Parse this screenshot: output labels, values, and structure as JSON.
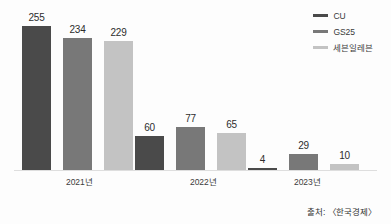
{
  "chart_data": {
    "type": "bar",
    "title": "",
    "subtitle": "",
    "xlabel": "",
    "ylabel": "",
    "categories": [
      "2021년",
      "2022년",
      "2023년"
    ],
    "series": [
      {
        "name": "CU",
        "color": "#4a4a4a",
        "values": [
          255,
          60,
          4
        ]
      },
      {
        "name": "GS25",
        "color": "#787878",
        "values": [
          234,
          77,
          29
        ]
      },
      {
        "name": "세븐일레븐",
        "color": "#c3c3c3",
        "values": [
          229,
          65,
          10
        ]
      }
    ],
    "ylim": [
      0,
      275
    ],
    "grid": false,
    "legend_position": "top-right",
    "data_labels": true
  },
  "legend": {
    "items": [
      {
        "label": "CU",
        "color": "#4a4a4a"
      },
      {
        "label": "GS25",
        "color": "#787878"
      },
      {
        "label": "세븐일레븐",
        "color": "#c3c3c3"
      }
    ]
  },
  "axis": {
    "categories": [
      "2021년",
      "2022년",
      "2023년"
    ]
  },
  "values": {
    "g0": [
      "255",
      "234",
      "229"
    ],
    "g1": [
      "60",
      "77",
      "65"
    ],
    "g2": [
      "4",
      "29",
      "10"
    ]
  },
  "footer": {
    "source": "출처: 〈한국경제〉"
  }
}
